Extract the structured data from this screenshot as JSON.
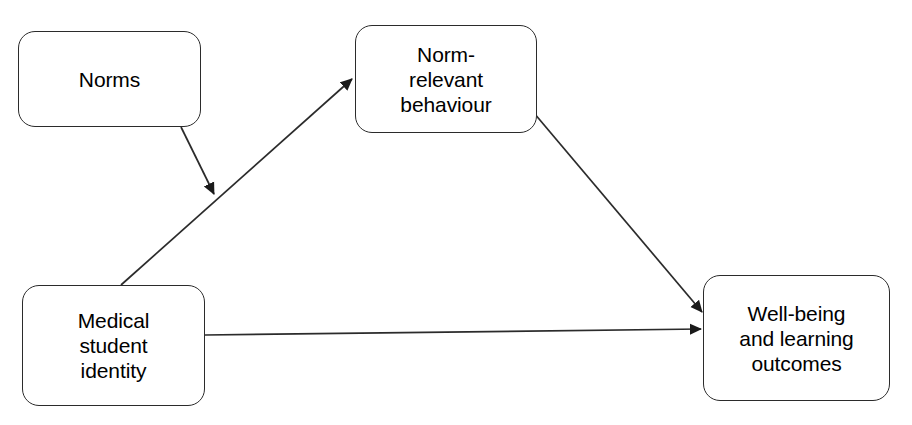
{
  "diagram": {
    "type": "flow-diagram",
    "background_color": "#ffffff",
    "line_color": "#2b2b2b",
    "text_color": "#000000",
    "nodes": [
      {
        "id": "norms",
        "label": "Norms",
        "shape": "rounded-rectangle"
      },
      {
        "id": "norm_relevant_behaviour",
        "label": "Norm-\nrelevant\nbehaviour",
        "shape": "rounded-rectangle"
      },
      {
        "id": "medical_student_identity",
        "label": "Medical\nstudent\nidentity",
        "shape": "rounded-rectangle"
      },
      {
        "id": "wellbeing_outcomes",
        "label": "Well-being\nand learning\noutcomes",
        "shape": "rounded-rectangle"
      }
    ],
    "edges": [
      {
        "id": "norms-to-identity-behaviour-path",
        "from": "norms",
        "to": "medical-student-identity-to-norm-relevant-behaviour",
        "style": "solid",
        "arrowhead": "filled-triangle"
      },
      {
        "id": "identity-to-behaviour",
        "from": "medical_student_identity",
        "to": "norm_relevant_behaviour",
        "style": "solid",
        "arrowhead": "filled-triangle"
      },
      {
        "id": "behaviour-to-outcomes",
        "from": "norm_relevant_behaviour",
        "to": "wellbeing_outcomes",
        "style": "solid",
        "arrowhead": "filled-triangle"
      },
      {
        "id": "identity-to-outcomes",
        "from": "medical_student_identity",
        "to": "wellbeing_outcomes",
        "style": "solid",
        "arrowhead": "filled-triangle"
      }
    ]
  }
}
